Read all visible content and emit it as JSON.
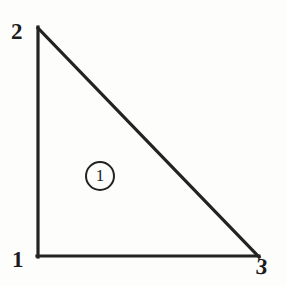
{
  "figure": {
    "kind": "triangular-element-diagram",
    "background_color": "#fdfdfc",
    "ink_color": "#232323",
    "stroke_width": 3
  },
  "element": {
    "badge_number": "1",
    "badge_shape": "circle",
    "badge_center": {
      "x": 100,
      "y": 176
    },
    "badge_diameter": 30
  },
  "nodes": [
    {
      "label": "1",
      "position": "bottom-left",
      "x": 38,
      "y": 256
    },
    {
      "label": "2",
      "position": "top-left",
      "x": 38,
      "y": 28
    },
    {
      "label": "3",
      "position": "bottom-right",
      "x": 258,
      "y": 256
    }
  ],
  "edges": [
    {
      "name": "left-edge",
      "from": "2",
      "to": "1"
    },
    {
      "name": "bottom-edge",
      "from": "1",
      "to": "3"
    },
    {
      "name": "hypotenuse-edge",
      "from": "2",
      "to": "3"
    }
  ]
}
